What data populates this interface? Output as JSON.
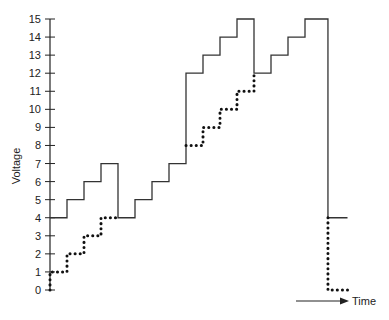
{
  "chart_data": {
    "type": "line",
    "title": "",
    "xlabel": "Time",
    "ylabel": "Voltage",
    "ylim": [
      0,
      15
    ],
    "yticks": [
      0,
      1,
      2,
      3,
      4,
      5,
      6,
      7,
      8,
      9,
      10,
      11,
      12,
      13,
      14,
      15
    ],
    "grid": false,
    "legend": null,
    "x_axis": "arrow labeled Time (no tick marks)",
    "series": [
      {
        "name": "solid staircase",
        "style": "solid step",
        "x": [
          0,
          1,
          2,
          3,
          4,
          5,
          6,
          7,
          8,
          9,
          10,
          11,
          12,
          13,
          14,
          15,
          16.35,
          17.5
        ],
        "values": [
          4,
          5,
          6,
          7,
          4,
          5,
          6,
          7,
          12,
          13,
          14,
          15,
          12,
          13,
          14,
          15,
          4,
          4
        ]
      },
      {
        "name": "dotted staircase",
        "style": "dotted step",
        "x": [
          0,
          0,
          1,
          2,
          3,
          4,
          8,
          9,
          10,
          11,
          12,
          16.35,
          16.35,
          17.5
        ],
        "values": [
          0,
          1,
          2,
          3,
          4,
          4,
          8,
          9,
          10,
          11,
          12,
          4,
          0,
          0
        ]
      }
    ]
  },
  "labels": {
    "ylabel": "Voltage",
    "xlabel": "Time"
  }
}
